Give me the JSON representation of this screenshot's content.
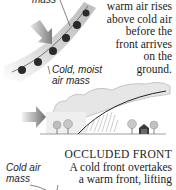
{
  "top_diagram": {
    "top_label_fragment": "mass",
    "label_cold_moist": [
      "Cold, moist",
      "air mass"
    ]
  },
  "caption_top": {
    "lines": [
      "warm air rises",
      "above cold air",
      "before the",
      "front arrives",
      "on the",
      "ground."
    ]
  },
  "bottom_section": {
    "heading": "OCCLUDED FRONT",
    "lines": [
      "A cold front overtakes",
      "a warm front, lifting"
    ],
    "label_cold_air": [
      "Cold air",
      "mass"
    ]
  },
  "colors": {
    "front_band": "#cfcfcf",
    "front_bumps": "#2a2a2a",
    "arrow": "#8a8a8a",
    "cloud": "#e4e4e4",
    "text": "#222222"
  }
}
